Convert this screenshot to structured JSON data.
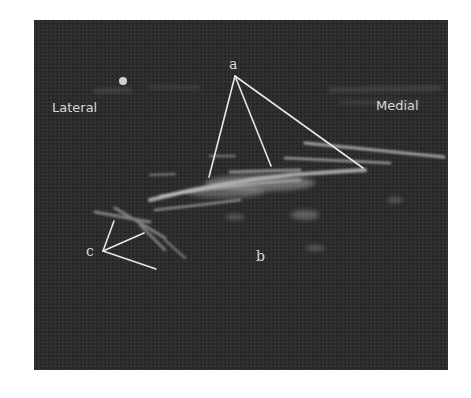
{
  "figure": {
    "type": "ultrasound-image",
    "orientation_labels": {
      "left": "Lateral",
      "right": "Medial"
    },
    "annotations": [
      {
        "label": "a",
        "pointer_count": 3
      },
      {
        "label": "b",
        "pointer_count": 0
      },
      {
        "label": "c",
        "pointer_count": 3
      }
    ],
    "colors": {
      "background": "#ffffff",
      "image_base": "#2e2e2e",
      "annotation": "#e6e6e6"
    }
  }
}
